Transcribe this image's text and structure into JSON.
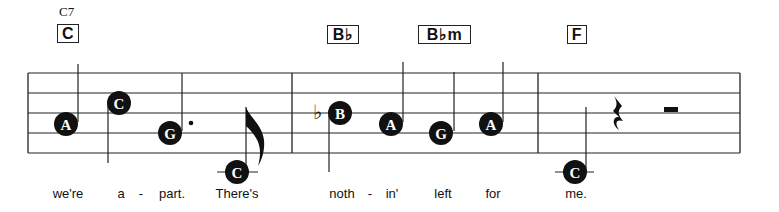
{
  "chords": [
    {
      "label": "C",
      "alt": "C7",
      "x": 57,
      "w": 22
    },
    {
      "label": "B♭",
      "x": 327,
      "w": 32
    },
    {
      "label": "B♭m",
      "x": 418,
      "w": 53
    },
    {
      "label": "F",
      "x": 567,
      "w": 20
    }
  ],
  "staff": {
    "left": 28,
    "right": 740,
    "lines_y": [
      73,
      93,
      113,
      133,
      153
    ],
    "barlines_x": [
      28,
      292,
      538,
      740
    ],
    "color": "#222222"
  },
  "notes": [
    {
      "name": "A",
      "x": 66,
      "y": 124
    },
    {
      "name": "C",
      "x": 119,
      "y": 103
    },
    {
      "name": "G",
      "x": 170,
      "y": 133,
      "dotted": true
    },
    {
      "name": "C",
      "x": 237,
      "y": 172,
      "ledger": true,
      "flag": true
    },
    {
      "name": "B",
      "x": 340,
      "y": 113,
      "accidental": "♭"
    },
    {
      "name": "A",
      "x": 391,
      "y": 124
    },
    {
      "name": "G",
      "x": 441,
      "y": 133
    },
    {
      "name": "A",
      "x": 491,
      "y": 124
    },
    {
      "name": "C",
      "x": 575,
      "y": 172,
      "ledger": true
    }
  ],
  "rests": [
    {
      "type": "quarter",
      "x": 618
    },
    {
      "type": "half",
      "x": 666
    }
  ],
  "lyrics": [
    {
      "text": "we're",
      "x": 68
    },
    {
      "text": "a",
      "x": 121
    },
    {
      "text": "-",
      "x": 141
    },
    {
      "text": "part.",
      "x": 172
    },
    {
      "text": "There's",
      "x": 237
    },
    {
      "text": "noth",
      "x": 342
    },
    {
      "text": "-",
      "x": 370
    },
    {
      "text": "in'",
      "x": 392
    },
    {
      "text": "left",
      "x": 443
    },
    {
      "text": "for",
      "x": 493
    },
    {
      "text": "me.",
      "x": 576
    }
  ]
}
